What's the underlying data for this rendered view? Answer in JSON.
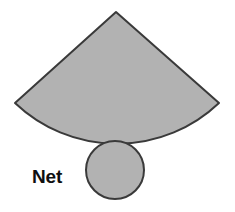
{
  "figure": {
    "title": "Net",
    "background_color": "#ffffff",
    "label": {
      "text": "Net",
      "color": "#101010",
      "x": 33,
      "y": 179
    },
    "style": {
      "fill_color": "#b2b2b2",
      "stroke_color": "#3a3a3a",
      "stroke_width": 2
    },
    "shapes": [
      {
        "name": "cone-lateral-sector",
        "type": "circular-sector",
        "fill": "#b2b2b2",
        "stroke": "#3a3a3a",
        "apex": {
          "x": 116,
          "y": 12
        },
        "radius": 148,
        "left_tip": {
          "x": 15,
          "y": 103
        },
        "right_tip": {
          "x": 219,
          "y": 103
        },
        "arc_bottom": {
          "x": 117,
          "y": 140
        },
        "path": "M 116 12 L 15 103 A 148 148 0 0 0 219 103 Z"
      },
      {
        "name": "cone-base-circle",
        "type": "circle",
        "fill": "#b2b2b2",
        "stroke": "#3a3a3a",
        "center": {
          "x": 115,
          "y": 170
        },
        "radius": 29
      }
    ]
  }
}
